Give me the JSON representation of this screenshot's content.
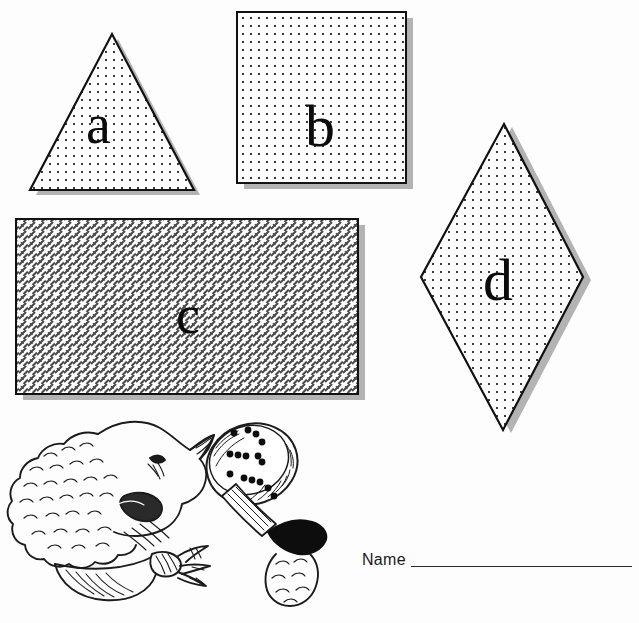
{
  "worksheet": {
    "title": "Shapes Identification Worksheet",
    "background_color": "#ffffff",
    "outline_color": "#111111",
    "shadow_color": "#b3b3b3",
    "width": 639,
    "height": 623
  },
  "shapes": [
    {
      "id": "shape-triangle",
      "label": "a",
      "name": "triangle",
      "fill_pattern": "dots",
      "pattern_color": "#3a3a3a",
      "has_shadow": true,
      "shadow_side": "bottom-right",
      "bounds": {
        "x": 22,
        "y": 30,
        "width": 170,
        "height": 156
      }
    },
    {
      "id": "shape-square",
      "label": "b",
      "name": "square",
      "fill_pattern": "dots",
      "pattern_color": "#3a3a3a",
      "has_shadow": true,
      "shadow_side": "bottom-right",
      "bounds": {
        "x": 237,
        "y": 12,
        "width": 169,
        "height": 171
      }
    },
    {
      "id": "shape-rectangle",
      "label": "c",
      "name": "rectangle",
      "fill_pattern": "crosshatch",
      "pattern_color": "#4a4a4a",
      "has_shadow": true,
      "shadow_side": "bottom-right",
      "bounds": {
        "x": 16,
        "y": 219,
        "width": 342,
        "height": 175
      }
    },
    {
      "id": "shape-rhombus",
      "label": "d",
      "name": "rhombus",
      "fill_pattern": "dots",
      "pattern_color": "#3a3a3a",
      "has_shadow": true,
      "shadow_side": "right",
      "bounds": {
        "x": 421,
        "y": 124,
        "width": 162,
        "height": 306
      }
    }
  ],
  "illustration": {
    "name": "sheep-with-magnifying-glass",
    "description": "hand drawn lamb head in profile holding a magnifying glass",
    "parts": [
      "lamb-head",
      "fleece",
      "ear",
      "eye",
      "muzzle",
      "neck-ribbon",
      "magnifying-glass",
      "lens-dots",
      "hoof-hand"
    ],
    "line_color": "#1b1b1b"
  },
  "name_field": {
    "label": "Name",
    "value": "",
    "line_color": "#2b2b2b"
  }
}
